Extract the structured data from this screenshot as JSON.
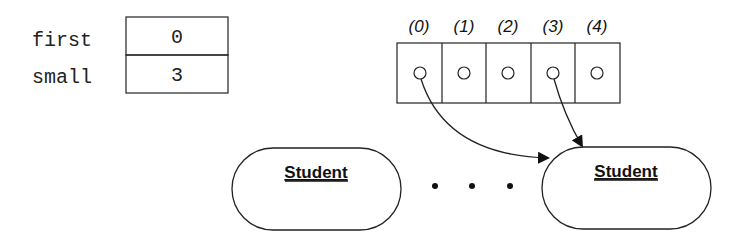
{
  "variables": [
    {
      "name": "first",
      "value": "0"
    },
    {
      "name": "small",
      "value": "3"
    }
  ],
  "array": {
    "indices": [
      "(0)",
      "(1)",
      "(2)",
      "(3)",
      "(4)"
    ],
    "references_from": [
      0,
      3
    ]
  },
  "objects": [
    {
      "label": "Student"
    },
    {
      "label": "Student"
    }
  ],
  "ellipsis": "• • •",
  "colors": {
    "stroke": "#222222",
    "background": "#ffffff"
  }
}
